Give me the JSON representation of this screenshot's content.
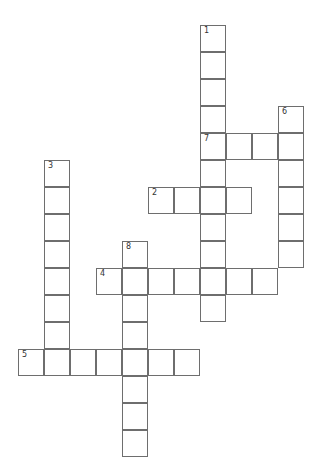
{
  "puzzle": {
    "type": "crossword",
    "cell_width": 26,
    "cell_height": 27,
    "origin_x": 18,
    "origin_y": 25,
    "colors": {
      "border": "#6e6e6e",
      "background": "#ffffff",
      "number": "#333333"
    },
    "words": [
      {
        "number": "1",
        "direction": "down",
        "col": 7,
        "row": 0,
        "length": 11
      },
      {
        "number": "2",
        "direction": "across",
        "col": 5,
        "row": 6,
        "length": 4
      },
      {
        "number": "3",
        "direction": "down",
        "col": 1,
        "row": 5,
        "length": 8
      },
      {
        "number": "4",
        "direction": "across",
        "col": 3,
        "row": 9,
        "length": 7
      },
      {
        "number": "5",
        "direction": "across",
        "col": 0,
        "row": 12,
        "length": 7
      },
      {
        "number": "6",
        "direction": "down",
        "col": 10,
        "row": 3,
        "length": 6
      },
      {
        "number": "7",
        "direction": "across",
        "col": 7,
        "row": 4,
        "length": 4
      },
      {
        "number": "8",
        "direction": "down",
        "col": 4,
        "row": 8,
        "length": 8
      }
    ]
  }
}
